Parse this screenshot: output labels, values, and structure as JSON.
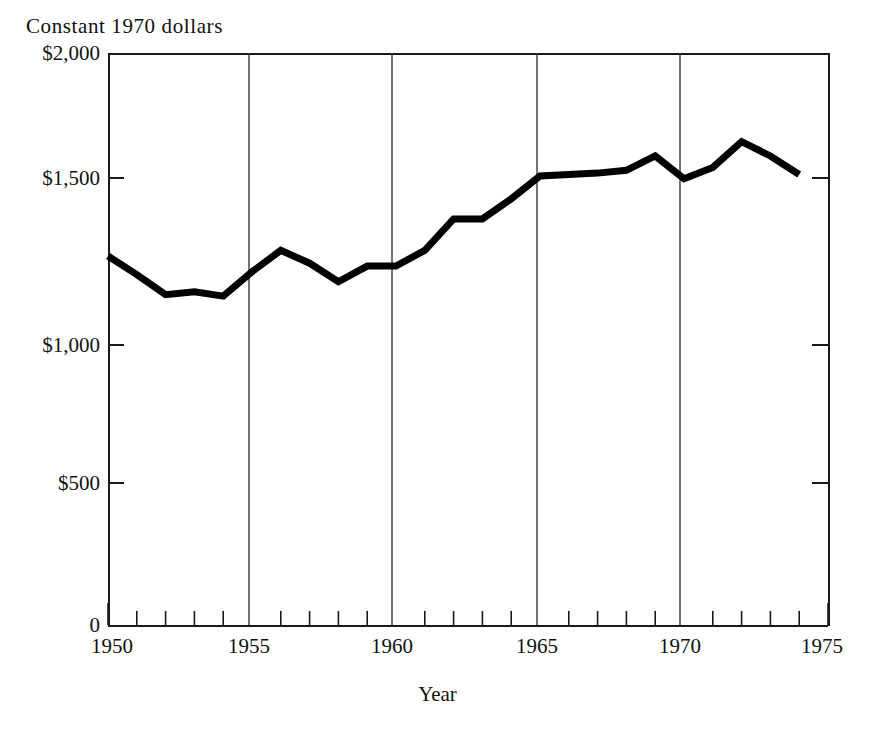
{
  "chart_data": {
    "type": "line",
    "title": "",
    "ylabel": "Constant 1970 dollars",
    "xlabel": "Year",
    "xlim": [
      1950,
      1975
    ],
    "ylim": [
      0,
      2000
    ],
    "grid": true,
    "grid_style": "vertical gridlines at major x ticks only",
    "legend": "none",
    "series": [
      {
        "name": "Constant 1970 dollars",
        "color": "#000000",
        "line_width": 7,
        "x": [
          1950,
          1951,
          1952,
          1953,
          1954,
          1955,
          1956,
          1957,
          1958,
          1959,
          1960,
          1961,
          1962,
          1963,
          1964,
          1965,
          1966,
          1967,
          1968,
          1969,
          1970,
          1971,
          1972,
          1973,
          1974
        ],
        "values": [
          1290,
          1225,
          1155,
          1165,
          1150,
          1235,
          1310,
          1265,
          1200,
          1255,
          1255,
          1310,
          1420,
          1420,
          1490,
          1570,
          1575,
          1580,
          1590,
          1640,
          1560,
          1600,
          1690,
          1640,
          1575
        ]
      }
    ],
    "y_ticks": [
      0,
      500,
      1000,
      1500,
      2000
    ],
    "y_tick_labels": [
      "0",
      "$500",
      "$1,000",
      "$1,500",
      "$2,000"
    ],
    "x_ticks": [
      1950,
      1955,
      1960,
      1965,
      1970,
      1975
    ],
    "x_tick_labels": [
      "1950",
      "1955",
      "1960",
      "1965",
      "1970",
      "1975"
    ],
    "x_minor_tick_interval": 1,
    "gridline_years": [
      1955,
      1960,
      1965,
      1970
    ]
  },
  "axes": {
    "y_caption": "Constant 1970 dollars",
    "x_title": "Year",
    "y_tick_labels": [
      "$2,000",
      "$1,500",
      "$1,000",
      "$500",
      "0"
    ],
    "x_tick_labels": [
      "1950",
      "1955",
      "1960",
      "1965",
      "1970",
      "1975"
    ]
  },
  "colors": {
    "line": "#000000",
    "axis": "#1a1a1a",
    "gridline": "#3a3a3a",
    "background": "#ffffff",
    "text": "#111111"
  }
}
